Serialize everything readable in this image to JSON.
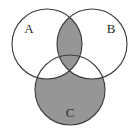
{
  "figure": {
    "kind": "venn-diagram",
    "set_count": 3,
    "background_color": "#ffffff",
    "shade_color": "#969696",
    "outline_color": "#3a3a3a",
    "label_color": "#2b2b2b",
    "width": 139,
    "height": 132
  },
  "circles": [
    {
      "id": "A",
      "label": "A",
      "cx": 47,
      "cy": 44,
      "r": 35,
      "label_x": 29,
      "label_y": 30
    },
    {
      "id": "B",
      "label": "B",
      "cx": 92,
      "cy": 44,
      "r": 35,
      "label_x": 111,
      "label_y": 30
    },
    {
      "id": "C",
      "label": "C",
      "cx": 70,
      "cy": 90,
      "r": 35,
      "label_x": 70,
      "label_y": 114
    }
  ],
  "regions": [
    {
      "id": "A-only",
      "name": "A only",
      "shaded": false
    },
    {
      "id": "B-only",
      "name": "B only",
      "shaded": false
    },
    {
      "id": "C-only",
      "name": "C only",
      "shaded": true
    },
    {
      "id": "AB",
      "name": "A and B only",
      "shaded": true
    },
    {
      "id": "AC",
      "name": "A and C only",
      "shaded": false
    },
    {
      "id": "BC",
      "name": "B and C only",
      "shaded": false
    },
    {
      "id": "ABC",
      "name": "A and B and C",
      "shaded": true
    },
    {
      "id": "outside",
      "name": "outside all sets",
      "shaded": false
    }
  ],
  "labels": {
    "a": "A",
    "b": "B",
    "c": "C"
  }
}
